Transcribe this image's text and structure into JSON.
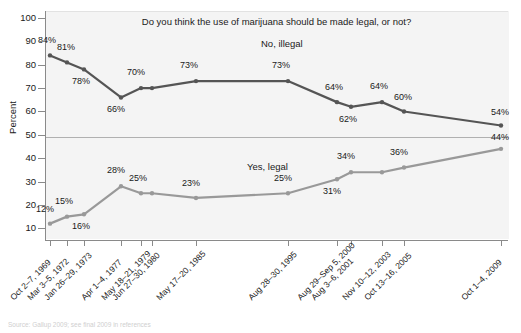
{
  "top_strip_text": "",
  "chart_title": "Do you think the use of marijuana should be made legal, or not?",
  "axes": {
    "ylabel": "Percent",
    "yticks": [
      "100",
      "90",
      "80",
      "70",
      "60",
      "50",
      "40",
      "30",
      "20",
      "10"
    ]
  },
  "series_labels": {
    "illegal": "No, illegal",
    "legal": "Yes, legal"
  },
  "source_note": "Source: Gallup 2009; see final 2009 in references",
  "colors": {
    "illegal_line": "#555555",
    "legal_line": "#999999",
    "panel_bg": "#f4f4f4",
    "axis": "#8a8a8a",
    "gridline": "#b0b0b0"
  },
  "chart_data": {
    "type": "line",
    "title": "Do you think the use of marijuana should be made legal, or not?",
    "xlabel": "",
    "ylabel": "Percent",
    "ylim": [
      5,
      103
    ],
    "grid": false,
    "legend_position": "inline-annotation",
    "categories": [
      "Oct 2–7, 1969",
      "Mar 3–5, 1972",
      "Jan 26–29, 1973",
      "Apr 1–4, 1977",
      "May 18–21, 1979",
      "Jun 27–30, 1980",
      "May 17–20, 1985",
      "Aug 28–30, 1995",
      "Aug 29–Sep 5, 2000",
      "Aug 3–6, 2001",
      "Nov 10–12, 2003",
      "Oct 13–16, 2005",
      "Oct 1–4, 2009"
    ],
    "series": [
      {
        "name": "No, illegal",
        "color": "#555555",
        "values": [
          84,
          81,
          78,
          66,
          70,
          70,
          73,
          73,
          64,
          62,
          64,
          60,
          54
        ],
        "labels": [
          "84%",
          "81%",
          "78%",
          "66%",
          "70%",
          "",
          "73%",
          "73%",
          "64%",
          "62%",
          "64%",
          "60%",
          "54%"
        ]
      },
      {
        "name": "Yes, legal",
        "color": "#999999",
        "values": [
          12,
          15,
          16,
          28,
          25,
          25,
          23,
          25,
          31,
          34,
          34,
          36,
          44
        ],
        "labels": [
          "12%",
          "15%",
          "16%",
          "28%",
          "25%",
          "",
          "23%",
          "25%",
          "31%",
          "34%",
          "",
          "36%",
          "44%"
        ]
      }
    ]
  }
}
